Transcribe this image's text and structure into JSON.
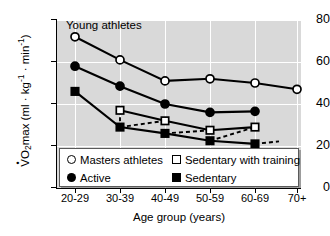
{
  "figure": {
    "annotation": "Young athletes",
    "plot_background": "#d9d9d9",
    "grid_color": "#ffffff",
    "series_color": "#000000"
  },
  "axes": {
    "x_title": "Age group (years)",
    "y_title_parts": {
      "main": "O",
      "sub": "2",
      "max": "max (ml ",
      "kg": "kg",
      "kg_sup": "-1",
      "min": "min",
      "min_sup": "-1",
      "close": ")"
    },
    "y_title_plain": "VO2max (ml · kg-1 · min-1)",
    "x_ticks": [
      "20-29",
      "30-39",
      "40-49",
      "50-59",
      "60-69",
      "70+"
    ],
    "y_ticks": [
      "0",
      "20",
      "40",
      "60",
      "80"
    ]
  },
  "legend": {
    "entries": [
      {
        "label": "Masters athletes",
        "marker": "circle-open"
      },
      {
        "label": "Sedentary with training",
        "marker": "square-open"
      },
      {
        "label": "Active",
        "marker": "circle-filled"
      },
      {
        "label": "Sedentary",
        "marker": "square-filled"
      }
    ]
  },
  "chart_data": {
    "type": "line",
    "title": "",
    "annotation": "Young athletes",
    "xlabel": "Age group (years)",
    "ylabel": "VO2max (ml · kg-1 · min-1)",
    "categories": [
      "20-29",
      "30-39",
      "40-49",
      "50-59",
      "60-69",
      "70+"
    ],
    "ylim": [
      0,
      80
    ],
    "yticks": [
      0,
      20,
      40,
      60,
      80
    ],
    "grid": true,
    "legend_position": "lower-left-inside",
    "series": [
      {
        "name": "Masters athletes",
        "marker": "circle-open",
        "line": "solid",
        "values": [
          72,
          61,
          51,
          52,
          50,
          47
        ]
      },
      {
        "name": "Active",
        "marker": "circle-filled",
        "line": "solid",
        "values": [
          58,
          48.5,
          40,
          36,
          36.5,
          null
        ]
      },
      {
        "name": "Sedentary",
        "marker": "square-filled",
        "line": "solid",
        "values": [
          46,
          29,
          26,
          22.5,
          21,
          null
        ]
      },
      {
        "name": "Sedentary with training",
        "marker": "square-open",
        "line": "dashed",
        "values": [
          null,
          37,
          32,
          27.5,
          29,
          null
        ]
      }
    ],
    "dashed_connectors": [
      {
        "from": "Sedentary with training 30-39",
        "to": "Sedentary 30-39"
      },
      {
        "from": "Sedentary 40-49",
        "to": "Sedentary with training 40-49"
      },
      {
        "from": "Sedentary with training 50-59",
        "to": "Sedentary 50-59"
      },
      {
        "from": "Sedentary 50-59",
        "to": "Sedentary with training 60-69"
      },
      {
        "from": "Sedentary 60-69",
        "to": "beyond 60-69"
      }
    ]
  }
}
